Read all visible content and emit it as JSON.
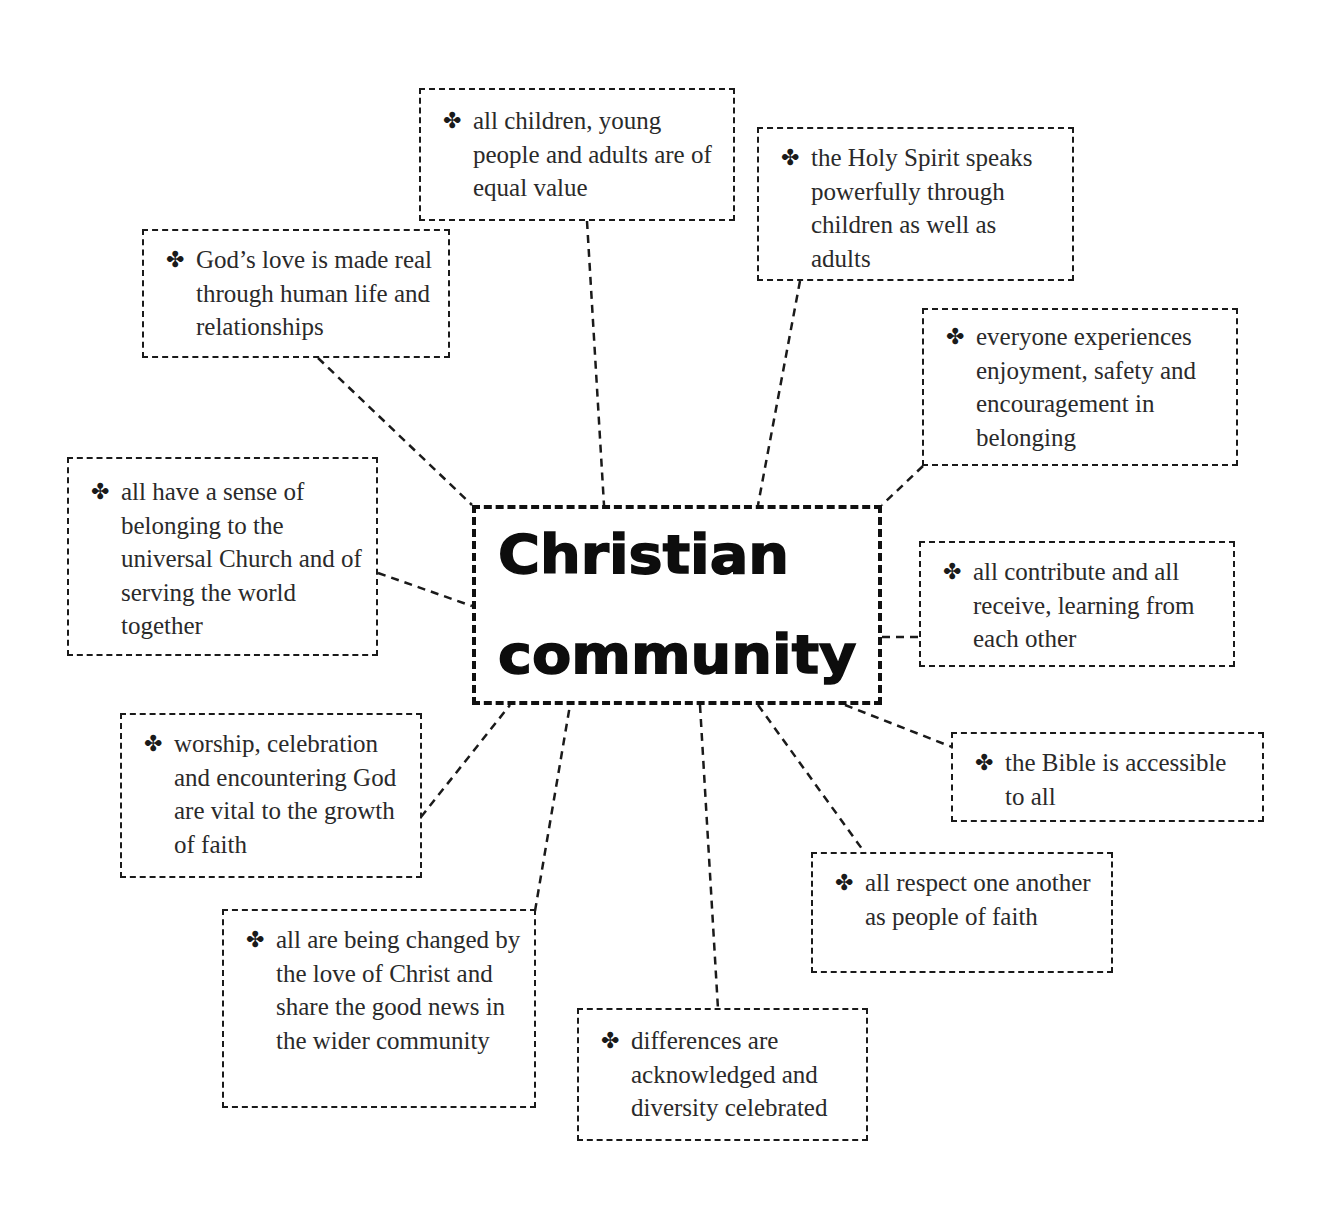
{
  "diagram": {
    "bullet_icon": "four-leaf-clover-bullet",
    "bullet_glyph": "✤",
    "center": {
      "line1": "Christian",
      "line2": "community"
    },
    "nodes": [
      {
        "id": "gods-love",
        "text": "God’s love is made real through human life and relationships"
      },
      {
        "id": "equal-value",
        "text": "all children, young people and adults are of equal value"
      },
      {
        "id": "holy-spirit",
        "text": "the Holy Spirit speaks powerfully through children as well as adults"
      },
      {
        "id": "enjoyment",
        "text": "everyone experiences enjoyment, safety and encouragement in belonging"
      },
      {
        "id": "universal-church",
        "text": "all have a sense of belonging to the universal Church and of serving the world together"
      },
      {
        "id": "contribute",
        "text": "all contribute and all receive, learning from each other"
      },
      {
        "id": "bible",
        "text": "the Bible is accessible to all"
      },
      {
        "id": "worship",
        "text": "worship, celebration and encountering God are vital to the growth of faith"
      },
      {
        "id": "respect",
        "text": "all respect one another as people of faith"
      },
      {
        "id": "changed",
        "text": "all are being changed by the love of Christ and share the good news in the wider community"
      },
      {
        "id": "differences",
        "text": "differences are acknowledged and diversity celebrated"
      }
    ]
  }
}
